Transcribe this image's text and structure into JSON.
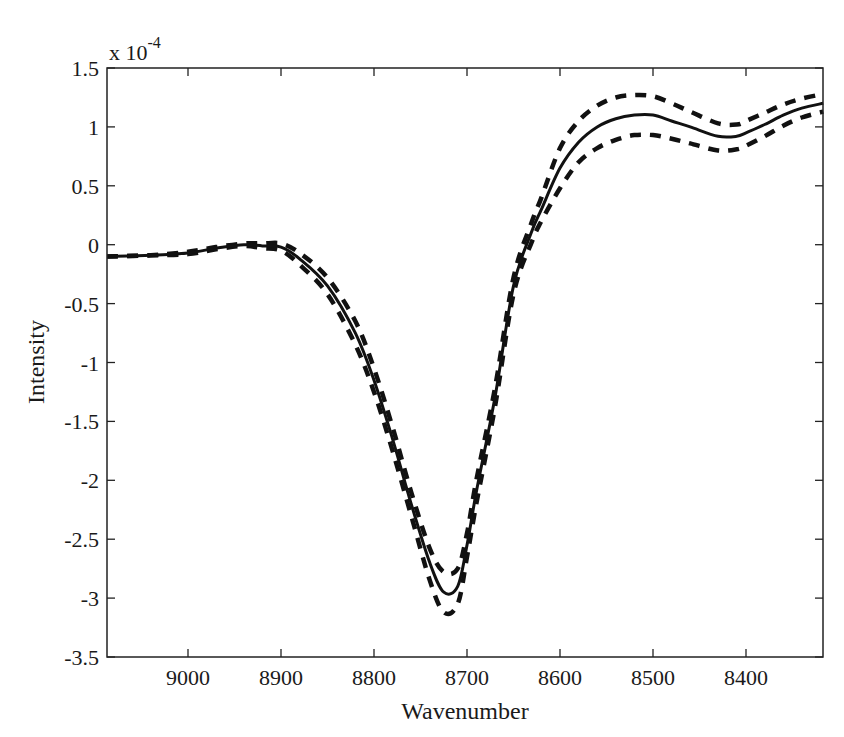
{
  "chart_data": {
    "type": "line",
    "title": "",
    "xlabel": "Wavenumber",
    "ylabel": "Intensity",
    "y_scale_label": "x 10",
    "y_scale_exponent": "-4",
    "xlim": [
      9087,
      8317
    ],
    "x_reversed": true,
    "ylim": [
      -3.5,
      1.5
    ],
    "grid": false,
    "legend": null,
    "x_ticks": [
      9000,
      8900,
      8800,
      8700,
      8600,
      8500,
      8400
    ],
    "x_tick_labels": [
      "9000",
      "8900",
      "8800",
      "8700",
      "8600",
      "8500",
      "8400"
    ],
    "y_ticks": [
      1.5,
      1,
      0.5,
      0,
      -0.5,
      -1,
      -1.5,
      -2,
      -2.5,
      -3,
      -3.5
    ],
    "y_tick_labels": [
      "1.5",
      "1",
      "0.5",
      "0",
      "-0.5",
      "-1",
      "-1.5",
      "-2",
      "-2.5",
      "-3",
      "-3.5"
    ],
    "x": [
      9087,
      9040,
      9000,
      8970,
      8940,
      8920,
      8900,
      8880,
      8850,
      8820,
      8800,
      8780,
      8760,
      8740,
      8725,
      8710,
      8700,
      8690,
      8670,
      8650,
      8630,
      8620,
      8600,
      8580,
      8560,
      8540,
      8520,
      8500,
      8480,
      8460,
      8430,
      8410,
      8400,
      8380,
      8360,
      8340,
      8317
    ],
    "series": [
      {
        "name": "estimate",
        "style": "solid",
        "values": [
          -0.1,
          -0.09,
          -0.07,
          -0.03,
          0.0,
          -0.01,
          -0.02,
          -0.12,
          -0.35,
          -0.75,
          -1.15,
          -1.65,
          -2.2,
          -2.7,
          -2.95,
          -2.9,
          -2.55,
          -2.1,
          -1.3,
          -0.35,
          0.12,
          0.3,
          0.65,
          0.87,
          1.0,
          1.07,
          1.1,
          1.1,
          1.05,
          1.0,
          0.92,
          0.92,
          0.95,
          1.02,
          1.1,
          1.16,
          1.2
        ]
      },
      {
        "name": "upper bound",
        "style": "dashed",
        "values": [
          -0.1,
          -0.09,
          -0.06,
          -0.02,
          0.01,
          0.01,
          0.01,
          -0.07,
          -0.28,
          -0.65,
          -1.05,
          -1.55,
          -2.1,
          -2.58,
          -2.78,
          -2.75,
          -2.45,
          -2.0,
          -1.22,
          -0.28,
          0.2,
          0.4,
          0.82,
          1.05,
          1.18,
          1.25,
          1.27,
          1.26,
          1.2,
          1.13,
          1.03,
          1.02,
          1.05,
          1.12,
          1.19,
          1.24,
          1.28
        ]
      },
      {
        "name": "lower bound",
        "style": "dashed",
        "values": [
          -0.1,
          -0.09,
          -0.08,
          -0.04,
          -0.01,
          -0.03,
          -0.05,
          -0.17,
          -0.42,
          -0.85,
          -1.25,
          -1.75,
          -2.3,
          -2.85,
          -3.12,
          -3.05,
          -2.65,
          -2.2,
          -1.38,
          -0.42,
          0.03,
          0.2,
          0.48,
          0.7,
          0.82,
          0.89,
          0.93,
          0.93,
          0.9,
          0.86,
          0.8,
          0.81,
          0.84,
          0.92,
          1.01,
          1.08,
          1.13
        ]
      }
    ]
  },
  "colors": {
    "line": "#111111",
    "axis": "#222222",
    "background": "#ffffff"
  }
}
